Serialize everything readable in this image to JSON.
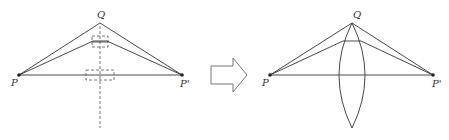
{
  "figure": {
    "colors": {
      "stroke": "#333333",
      "dashed": "#555555",
      "arrow": "#666666",
      "background": "#ffffff"
    },
    "left_panel": {
      "labels": {
        "P": "P",
        "P_prime": "P'",
        "Q": "Q"
      },
      "points": {
        "P": [
          19,
          75
        ],
        "P_prime": [
          182,
          75
        ],
        "Q": [
          100,
          23
        ]
      },
      "dashed_axis": {
        "x": 100,
        "y_top": 26,
        "y_bottom": 128
      },
      "upper_segment_y": 42
    },
    "transition_arrow": {
      "direction": "right",
      "icon": "hollow-arrow-right"
    },
    "right_panel": {
      "labels": {
        "P": "P",
        "P_prime": "P'",
        "Q": "Q"
      },
      "points": {
        "P": [
          270,
          75
        ],
        "P_prime": [
          433,
          75
        ],
        "Q": [
          352,
          23
        ]
      },
      "lens": {
        "top": [
          352,
          23
        ],
        "bottom": [
          352,
          128
        ],
        "half_width": 13
      }
    }
  }
}
